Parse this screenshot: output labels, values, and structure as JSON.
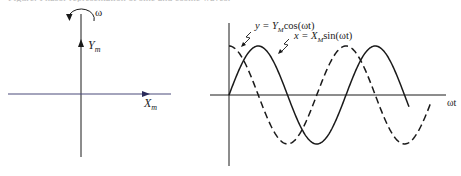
{
  "caption": {
    "text": "Figure: Phasor representation of sine and cosine waves."
  },
  "phasor_diagram": {
    "rotation_label": "ω",
    "vertical_axis_label": "Y",
    "vertical_axis_sub": "m",
    "horizontal_axis_label": "X",
    "horizontal_axis_sub": "m"
  },
  "wave_plot": {
    "x_axis_label": "ωt",
    "cos_label": {
      "lhs": "y = Y",
      "sub": "M",
      "rhs": "cos(ωt)"
    },
    "sin_label": {
      "lhs": "x = X",
      "sub": "M",
      "rhs": "sin(ωt)"
    }
  },
  "chart_data": {
    "type": "line",
    "title": "",
    "xlabel": "ωt",
    "ylabel": "",
    "grid": false,
    "series": [
      {
        "name": "x = X_M sin(ωt)",
        "style": "solid",
        "function": "sin",
        "x_range_periods": [
          0,
          1.54
        ]
      },
      {
        "name": "y = Y_M cos(ωt)",
        "style": "dashed",
        "function": "cos",
        "x_range_periods": [
          0,
          1.73
        ]
      }
    ],
    "amplitude": 1,
    "legend_position": "annotations at top with leader marks"
  },
  "colors": {
    "stroke": "#1a1a1a",
    "horizontal_axis_left": "#4a4a7a"
  }
}
